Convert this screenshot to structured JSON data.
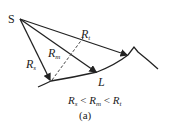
{
  "diagram": {
    "point_label": "S",
    "rays": [
      {
        "name": "R",
        "sub": "s"
      },
      {
        "name": "R",
        "sub": "m"
      },
      {
        "name": "R",
        "sub": "t"
      }
    ],
    "point_L": "L",
    "relation": {
      "a": "R",
      "a_sub": "s",
      "op1": " < ",
      "b": "R",
      "b_sub": "m",
      "op2": " < ",
      "c": "R",
      "c_sub": "t"
    },
    "caption": "(a)"
  }
}
